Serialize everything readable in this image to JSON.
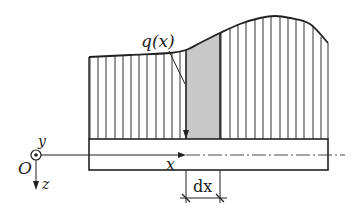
{
  "diagram": {
    "type": "distributed-load-on-beam",
    "labels": {
      "load": "q(x)",
      "x_axis": "x",
      "y_axis": "y",
      "z_axis": "z",
      "origin": "O",
      "element_width": "dx"
    },
    "colors": {
      "line": "#222222",
      "hatch": "#444444",
      "shaded_element": "#c8c8c8",
      "background": "#ffffff"
    },
    "beam": {
      "x0": 89,
      "x1": 328,
      "top": 139,
      "bottom": 170
    },
    "axis_y": 155,
    "origin": {
      "x": 36,
      "y": 155
    },
    "element": {
      "x0": 186,
      "x1": 220
    },
    "load_curve": [
      [
        89,
        57
      ],
      [
        130,
        55
      ],
      [
        170,
        53
      ],
      [
        186,
        50
      ],
      [
        200,
        43
      ],
      [
        220,
        33
      ],
      [
        240,
        24
      ],
      [
        260,
        18
      ],
      [
        275,
        16
      ],
      [
        290,
        18
      ],
      [
        310,
        24
      ],
      [
        328,
        43
      ]
    ],
    "hatch_x": [
      90,
      98,
      106,
      115,
      123,
      131,
      139,
      147,
      156,
      164,
      172,
      180,
      221,
      230,
      238,
      246,
      255,
      263,
      271,
      280,
      288,
      296,
      304,
      313,
      321,
      328
    ]
  }
}
